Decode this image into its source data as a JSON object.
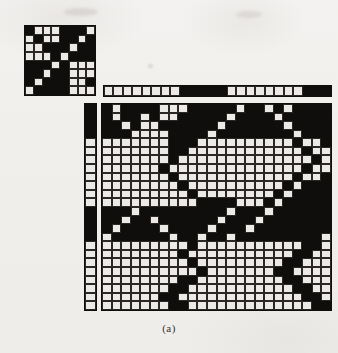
{
  "figure": {
    "caption": "(a)",
    "colors": {
      "ink": "#100e0c",
      "cell_empty": "#eceae6",
      "paper": "#f2f0ee"
    },
    "panels": {
      "small_matrix": {
        "name": "small-block-matrix",
        "rows": 8,
        "cols": 8,
        "grid": [
          [
            1,
            0,
            0,
            0,
            1,
            1,
            1,
            0
          ],
          [
            0,
            1,
            0,
            0,
            1,
            1,
            0,
            1
          ],
          [
            0,
            0,
            1,
            1,
            1,
            0,
            1,
            1
          ],
          [
            0,
            0,
            0,
            1,
            0,
            1,
            1,
            1
          ],
          [
            1,
            1,
            1,
            0,
            1,
            0,
            0,
            0
          ],
          [
            1,
            1,
            0,
            1,
            1,
            0,
            0,
            0
          ],
          [
            1,
            0,
            1,
            1,
            1,
            0,
            0,
            1
          ],
          [
            0,
            1,
            1,
            1,
            1,
            0,
            0,
            0
          ]
        ]
      },
      "row_bar": {
        "name": "column-partition-bar",
        "rows": 1,
        "cols": 24,
        "grid": [
          [
            0,
            0,
            0,
            0,
            0,
            0,
            0,
            0,
            1,
            1,
            1,
            1,
            1,
            0,
            0,
            0,
            0,
            0,
            0,
            0,
            0,
            1,
            1,
            1
          ]
        ]
      },
      "col_bar": {
        "name": "row-partition-bar",
        "rows": 24,
        "cols": 1,
        "grid": [
          [
            1
          ],
          [
            1
          ],
          [
            1
          ],
          [
            1
          ],
          [
            0
          ],
          [
            0
          ],
          [
            0
          ],
          [
            0
          ],
          [
            0
          ],
          [
            0
          ],
          [
            0
          ],
          [
            0
          ],
          [
            1
          ],
          [
            1
          ],
          [
            1
          ],
          [
            1
          ],
          [
            0
          ],
          [
            0
          ],
          [
            0
          ],
          [
            0
          ],
          [
            0
          ],
          [
            0
          ],
          [
            0
          ],
          [
            0
          ]
        ]
      },
      "main_matrix": {
        "name": "main-binary-matrix",
        "rows": 24,
        "cols": 24,
        "grid": [
          [
            1,
            0,
            1,
            1,
            1,
            1,
            0,
            0,
            0,
            1,
            1,
            1,
            1,
            1,
            0,
            1,
            1,
            0,
            1,
            0,
            1,
            1,
            1,
            1
          ],
          [
            1,
            0,
            1,
            1,
            0,
            1,
            0,
            0,
            1,
            1,
            1,
            1,
            1,
            0,
            1,
            1,
            1,
            1,
            0,
            1,
            1,
            1,
            1,
            1
          ],
          [
            1,
            1,
            0,
            1,
            0,
            0,
            1,
            1,
            1,
            1,
            1,
            1,
            0,
            1,
            1,
            1,
            1,
            1,
            1,
            0,
            1,
            1,
            1,
            1
          ],
          [
            1,
            1,
            1,
            0,
            0,
            0,
            0,
            1,
            1,
            1,
            1,
            0,
            1,
            1,
            1,
            1,
            1,
            1,
            1,
            1,
            0,
            1,
            1,
            1
          ],
          [
            0,
            0,
            0,
            0,
            0,
            0,
            0,
            1,
            1,
            1,
            0,
            0,
            0,
            0,
            0,
            0,
            0,
            0,
            0,
            0,
            1,
            0,
            0,
            1
          ],
          [
            0,
            0,
            0,
            0,
            0,
            0,
            0,
            1,
            1,
            0,
            0,
            0,
            0,
            0,
            0,
            0,
            0,
            0,
            0,
            0,
            0,
            1,
            0,
            0
          ],
          [
            0,
            0,
            0,
            0,
            0,
            0,
            0,
            1,
            0,
            0,
            0,
            0,
            0,
            0,
            0,
            0,
            0,
            0,
            0,
            0,
            0,
            0,
            1,
            0
          ],
          [
            0,
            0,
            0,
            0,
            0,
            0,
            1,
            0,
            0,
            0,
            0,
            0,
            0,
            0,
            0,
            0,
            0,
            0,
            0,
            0,
            0,
            1,
            0,
            0
          ],
          [
            0,
            0,
            0,
            0,
            0,
            0,
            0,
            1,
            0,
            0,
            0,
            0,
            0,
            0,
            0,
            0,
            0,
            0,
            0,
            0,
            1,
            0,
            0,
            1
          ],
          [
            0,
            0,
            0,
            0,
            0,
            0,
            0,
            0,
            1,
            0,
            0,
            0,
            0,
            0,
            0,
            0,
            0,
            0,
            0,
            1,
            0,
            1,
            1,
            1
          ],
          [
            0,
            0,
            0,
            0,
            0,
            0,
            0,
            0,
            0,
            1,
            0,
            0,
            0,
            0,
            0,
            0,
            0,
            0,
            1,
            0,
            1,
            1,
            1,
            1
          ],
          [
            0,
            0,
            0,
            0,
            0,
            0,
            0,
            0,
            0,
            0,
            1,
            1,
            1,
            1,
            0,
            0,
            0,
            1,
            0,
            1,
            1,
            1,
            1,
            1
          ],
          [
            1,
            1,
            1,
            0,
            1,
            1,
            1,
            1,
            1,
            1,
            1,
            1,
            1,
            0,
            1,
            1,
            1,
            0,
            1,
            1,
            1,
            1,
            1,
            1
          ],
          [
            1,
            1,
            0,
            1,
            1,
            0,
            1,
            1,
            1,
            1,
            1,
            1,
            0,
            1,
            1,
            1,
            0,
            1,
            1,
            1,
            1,
            1,
            1,
            1
          ],
          [
            1,
            0,
            1,
            1,
            1,
            1,
            0,
            1,
            1,
            1,
            1,
            0,
            1,
            1,
            1,
            0,
            1,
            1,
            1,
            1,
            1,
            1,
            1,
            1
          ],
          [
            0,
            1,
            1,
            1,
            1,
            1,
            1,
            0,
            1,
            1,
            0,
            1,
            1,
            0,
            1,
            1,
            1,
            1,
            1,
            1,
            1,
            1,
            1,
            0
          ],
          [
            0,
            0,
            0,
            0,
            0,
            0,
            0,
            0,
            0,
            1,
            0,
            0,
            0,
            0,
            0,
            0,
            0,
            0,
            0,
            0,
            0,
            1,
            1,
            0
          ],
          [
            0,
            0,
            0,
            0,
            0,
            0,
            0,
            0,
            1,
            0,
            0,
            0,
            0,
            0,
            0,
            0,
            0,
            0,
            0,
            0,
            1,
            1,
            0,
            0
          ],
          [
            0,
            0,
            0,
            0,
            0,
            0,
            0,
            0,
            0,
            1,
            0,
            0,
            0,
            0,
            0,
            0,
            0,
            0,
            0,
            1,
            1,
            0,
            0,
            0
          ],
          [
            0,
            0,
            0,
            0,
            0,
            0,
            0,
            0,
            0,
            0,
            1,
            0,
            0,
            0,
            0,
            0,
            0,
            0,
            1,
            1,
            0,
            0,
            0,
            0
          ],
          [
            0,
            0,
            0,
            0,
            0,
            0,
            0,
            0,
            1,
            1,
            0,
            0,
            0,
            0,
            0,
            0,
            0,
            0,
            0,
            1,
            1,
            0,
            0,
            0
          ],
          [
            0,
            0,
            0,
            0,
            0,
            0,
            0,
            1,
            1,
            0,
            0,
            0,
            0,
            0,
            0,
            0,
            0,
            0,
            0,
            0,
            1,
            1,
            0,
            0
          ],
          [
            0,
            0,
            0,
            0,
            0,
            0,
            1,
            1,
            0,
            0,
            0,
            0,
            0,
            0,
            0,
            0,
            0,
            0,
            0,
            0,
            0,
            1,
            1,
            0
          ],
          [
            0,
            0,
            0,
            0,
            0,
            0,
            0,
            1,
            1,
            0,
            0,
            0,
            0,
            0,
            0,
            0,
            0,
            0,
            0,
            0,
            0,
            0,
            1,
            1
          ]
        ]
      }
    }
  }
}
